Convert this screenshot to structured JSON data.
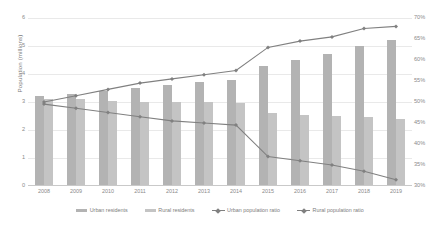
{
  "chart_data": {
    "type": "bar",
    "title": "",
    "subtitle": "",
    "xlabel": "",
    "ylabel": "Population (millions)",
    "ylabel_secondary": "",
    "categories": [
      "2008",
      "2009",
      "2010",
      "2011",
      "2012",
      "2013",
      "2014",
      "2015",
      "2016",
      "2017",
      "2018",
      "2019"
    ],
    "ylim": [
      0,
      6
    ],
    "yticks": [
      "0",
      "1",
      "2",
      "3",
      "4",
      "5",
      "6"
    ],
    "ylim_secondary": [
      30,
      70
    ],
    "yticks_secondary": [
      "30%",
      "35%",
      "40%",
      "45%",
      "50%",
      "55%",
      "60%",
      "65%",
      "70%"
    ],
    "grid": true,
    "legend_position": "bottom",
    "series": [
      {
        "name": "Urban residents",
        "type": "bar",
        "axis": "left",
        "color": "#b3b3b3",
        "values": [
          3.2,
          3.3,
          3.4,
          3.5,
          3.6,
          3.7,
          3.8,
          4.3,
          4.5,
          4.7,
          5.0,
          5.2
        ]
      },
      {
        "name": "Rural residents",
        "type": "bar",
        "axis": "left",
        "color": "#c4c4c4",
        "values": [
          3.1,
          3.1,
          3.05,
          3.0,
          3.0,
          3.0,
          2.95,
          2.6,
          2.55,
          2.5,
          2.45,
          2.4
        ]
      },
      {
        "name": "Urban population ratio",
        "type": "line",
        "axis": "right",
        "color": "#808080",
        "values": [
          50.0,
          51.5,
          53.0,
          54.5,
          55.5,
          56.5,
          57.5,
          63.0,
          64.5,
          65.5,
          67.5,
          68.0
        ]
      },
      {
        "name": "Rural population ratio",
        "type": "line",
        "axis": "right",
        "color": "#808080",
        "values": [
          49.5,
          48.5,
          47.5,
          46.5,
          45.5,
          45.0,
          44.5,
          37.0,
          36.0,
          35.0,
          33.5,
          31.5
        ]
      }
    ]
  }
}
